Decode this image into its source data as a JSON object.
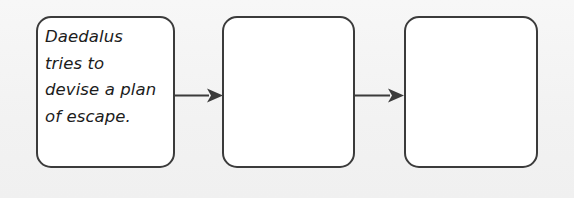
{
  "diagram": {
    "type": "flowchart",
    "orientation": "left-to-right",
    "background_color": "#f2f2f2",
    "node_fill_color": "#ffffff",
    "node_border_color": "#3b3b3b",
    "connector_color": "#3b3b3b",
    "text_color": "#1c1c1c",
    "nodes": [
      {
        "id": "node-1",
        "text": "Daedalus\ntries to\ndevise a plan\nof escape.",
        "lines": [
          "Daedalus",
          "tries to",
          "devise a plan",
          "of escape."
        ],
        "filled": true
      },
      {
        "id": "node-2",
        "text": "",
        "lines": [],
        "filled": false
      },
      {
        "id": "node-3",
        "text": "",
        "lines": [],
        "filled": false
      }
    ],
    "connectors": [
      {
        "id": "arrow-1",
        "from": "node-1",
        "to": "node-2",
        "style": "solid-arrow"
      },
      {
        "id": "arrow-2",
        "from": "node-2",
        "to": "node-3",
        "style": "solid-arrow"
      }
    ]
  }
}
